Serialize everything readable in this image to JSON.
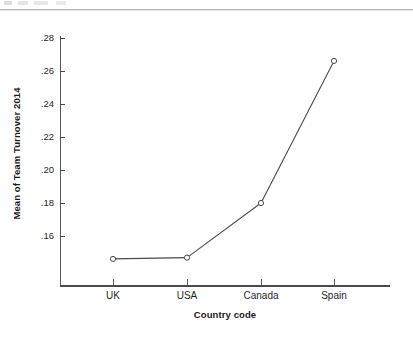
{
  "page": {
    "background_color": "#ffffff",
    "rule_color": "#b9b9b9"
  },
  "chart_data": {
    "type": "line",
    "title": "",
    "subtitle": "",
    "xlabel": "Country code",
    "ylabel": "Mean of Team Turnover 2014",
    "categories": [
      "UK",
      "USA",
      "Canada",
      "Spain"
    ],
    "values": [
      0.1595,
      0.1602,
      0.19,
      0.2675
    ],
    "series": [
      {
        "name": "Mean of Team Turnover 2014",
        "values": [
          0.1595,
          0.1602,
          0.19,
          0.2675
        ]
      }
    ],
    "y_tick_labels": [
      ".28",
      ".26",
      ".24",
      ".22",
      ".20",
      ".18",
      ".16"
    ],
    "y_tick_values": [
      0.28,
      0.26,
      0.24,
      0.22,
      0.2,
      0.18,
      0.16
    ],
    "ylim": [
      0.148,
      0.28
    ],
    "xlim": [
      0,
      5
    ],
    "grid": false,
    "legend": "none",
    "marker": "open-circle",
    "line_color": "#4a4a4a",
    "marker_color": "#4a4a4a"
  },
  "axes": {
    "y_title": "Mean of Team Turnover 2014",
    "x_title": "Country code",
    "y_ticks": [
      {
        "label": ".28"
      },
      {
        "label": ".26"
      },
      {
        "label": ".24"
      },
      {
        "label": ".22"
      },
      {
        "label": ".20"
      },
      {
        "label": ".18"
      },
      {
        "label": ".16"
      }
    ],
    "x_ticks": [
      {
        "label": "UK"
      },
      {
        "label": "USA"
      },
      {
        "label": "Canada"
      },
      {
        "label": "Spain"
      }
    ]
  }
}
